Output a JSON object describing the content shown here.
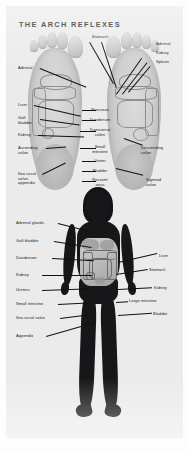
{
  "page": {
    "title": "THE ARCH REFLEXES",
    "background_color": "#ebebeb",
    "text_color": "#1c1c1c"
  },
  "foot_diagram": {
    "name": "arch-reflexes-foot-chart",
    "description": "Pair of foot soles showing reflexology zones",
    "labels_left": [
      {
        "text": "Adrenal",
        "x": 12,
        "y": 60
      },
      {
        "text": "Liver",
        "x": 12,
        "y": 97
      },
      {
        "text": "Gall\nbladder",
        "x": 12,
        "y": 110
      },
      {
        "text": "Kidney",
        "x": 12,
        "y": 127
      },
      {
        "text": "Ascending\ncolon",
        "x": 12,
        "y": 140
      },
      {
        "text": "Ileo-cecal\nvalve,\nappendix",
        "x": 12,
        "y": 166
      }
    ],
    "labels_right": [
      {
        "text": "Adrenal",
        "x": 150,
        "y": 36
      },
      {
        "text": "Kidney",
        "x": 150,
        "y": 45
      },
      {
        "text": "Spleen",
        "x": 150,
        "y": 54
      },
      {
        "text": "Descending\ncolon",
        "x": 135,
        "y": 140
      },
      {
        "text": "Sigmoid\ncolon",
        "x": 140,
        "y": 172
      }
    ],
    "labels_center": [
      {
        "text": "Stomach",
        "x": 94,
        "y": 29
      },
      {
        "text": "Pancreas",
        "x": 94,
        "y": 102
      },
      {
        "text": "Duodenum",
        "x": 94,
        "y": 112
      },
      {
        "text": "Transverse\ncolon",
        "x": 94,
        "y": 122
      },
      {
        "text": "Small\nintestine",
        "x": 94,
        "y": 139
      },
      {
        "text": "Ureter",
        "x": 94,
        "y": 153
      },
      {
        "text": "Bladder",
        "x": 94,
        "y": 163
      },
      {
        "text": "Rectum/\nanus",
        "x": 94,
        "y": 172
      }
    ]
  },
  "body_diagram": {
    "name": "female-body-organ-chart",
    "description": "Female silhouette showing corresponding abdominal organs",
    "labels_left": [
      {
        "text": "Adrenal glands",
        "x": 10,
        "y": 215
      },
      {
        "text": "Gall bladder",
        "x": 10,
        "y": 233
      },
      {
        "text": "Duodenum",
        "x": 10,
        "y": 250
      },
      {
        "text": "Kidney",
        "x": 10,
        "y": 267
      },
      {
        "text": "Ureters",
        "x": 10,
        "y": 282
      },
      {
        "text": "Small intestine",
        "x": 10,
        "y": 296
      },
      {
        "text": "Ileo-cecal valve",
        "x": 10,
        "y": 310
      },
      {
        "text": "Appendix",
        "x": 10,
        "y": 328
      }
    ],
    "labels_right": [
      {
        "text": "Liver",
        "x": 153,
        "y": 248
      },
      {
        "text": "Stomach",
        "x": 143,
        "y": 262
      },
      {
        "text": "Kidney",
        "x": 148,
        "y": 280
      },
      {
        "text": "Large intestine",
        "x": 123,
        "y": 293
      },
      {
        "text": "Bladder",
        "x": 147,
        "y": 306
      }
    ]
  }
}
